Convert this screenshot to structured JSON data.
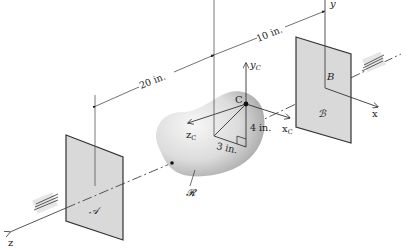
{
  "figure": {
    "type": "3D mechanics diagram: rigid body on shaft between bearings",
    "colors": {
      "plate_fill": "#d9d9d9",
      "plate_edge": "#333333",
      "body_light": "#f4f4f4",
      "body_dark": "#9a9a9a",
      "line": "#444444",
      "bearing_fill": "#e6e6e6"
    }
  },
  "labels": {
    "dim_20": "20 in.",
    "dim_10": "10 in.",
    "dim_4": "4 in.",
    "dim_3": "3 in.",
    "point_C": "C",
    "point_B": "B",
    "plate_A": "𝒜",
    "plate_B": "ℬ",
    "body_R": "𝓡",
    "axis_x": "x",
    "axis_y": "y",
    "axis_z": "z",
    "axis_xc": "x",
    "axis_yc": "y",
    "axis_zc": "z",
    "sub_c": "C"
  }
}
